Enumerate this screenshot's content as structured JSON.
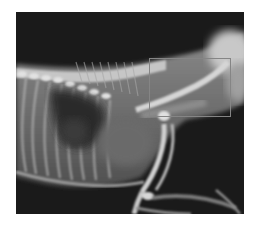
{
  "figure": {
    "kind": "lateral radiograph",
    "background_color": "#1c1c1c",
    "annotation": {
      "shape": "rectangle",
      "color": "#858585",
      "region": "cervical / cranial thoracic area",
      "bounds_px": {
        "x": 149,
        "y": 58,
        "width": 82,
        "height": 59
      }
    }
  }
}
